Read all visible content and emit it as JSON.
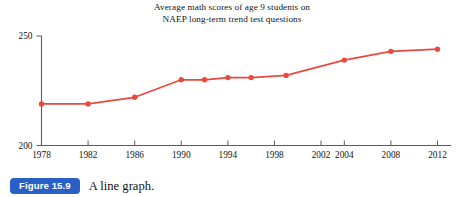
{
  "caption": {
    "badge_label": "Figure 15.9",
    "badge_color": "#2a5fc8",
    "text": "A line graph."
  },
  "chart_data": {
    "type": "line",
    "title": "Average math scores of age 9 students on NAEP long-term trend test questions",
    "title_lines": [
      "Average math scores of age 9 students on",
      "NAEP long-term trend test questions"
    ],
    "xlabel": "",
    "ylabel": "",
    "x": [
      1978,
      1982,
      1986,
      1990,
      1992,
      1994,
      1996,
      1999,
      2004,
      2008,
      2012
    ],
    "values": [
      219,
      219,
      222,
      230,
      230,
      231,
      231,
      232,
      239,
      243,
      244
    ],
    "xlim": [
      1978,
      2012
    ],
    "ylim": [
      200,
      250
    ],
    "x_ticks": [
      1978,
      1982,
      1986,
      1990,
      1994,
      1998,
      2002,
      2004,
      2008,
      2012
    ],
    "x_tick_labels": [
      "1978",
      "1982",
      "1986",
      "1990",
      "1994",
      "1998",
      "2002",
      "2004",
      "2008",
      "2012"
    ],
    "y_ticks": [
      200,
      250
    ],
    "y_tick_labels": [
      "200",
      "250"
    ],
    "grid": false,
    "legend": "none",
    "series_color": "#e84a3f",
    "marker": "circle",
    "axis_color": "#5c5c5c"
  }
}
